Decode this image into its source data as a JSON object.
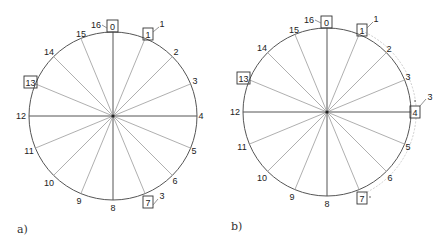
{
  "figure": {
    "panels": [
      {
        "id": "a",
        "label": "a)",
        "center": [
          113,
          116
        ],
        "radius": 84,
        "positions": 16,
        "boxed": [
          "0",
          "1",
          "7",
          "13"
        ],
        "annotations": [
          {
            "text": "16",
            "near": "0"
          },
          {
            "text": "1",
            "near": "1"
          },
          {
            "text": "3",
            "near": "7"
          }
        ]
      },
      {
        "id": "b",
        "label": "b)",
        "center": [
          327,
          112
        ],
        "radius": 84,
        "positions": 16,
        "boxed": [
          "0",
          "1",
          "4",
          "7",
          "13"
        ],
        "annotations": [
          {
            "text": "16",
            "near": "0"
          },
          {
            "text": "1",
            "near": "1"
          },
          {
            "text": "3",
            "near": "4"
          }
        ],
        "arcs": [
          [
            "1",
            "4"
          ],
          [
            "4",
            "7"
          ]
        ]
      }
    ],
    "tick_labels": [
      "0",
      "1",
      "2",
      "3",
      "4",
      "5",
      "6",
      "7",
      "8",
      "9",
      "10",
      "11",
      "12",
      "13",
      "14",
      "15"
    ]
  },
  "panel_a": {
    "label": "a)",
    "lbl": {
      "0": "0",
      "1": "1",
      "2": "2",
      "3": "3",
      "4": "4",
      "5": "5",
      "6": "6",
      "7": "7",
      "8": "8",
      "9": "9",
      "10": "10",
      "11": "11",
      "12": "12",
      "13": "13",
      "14": "14",
      "15": "15"
    },
    "ann_16": "16",
    "ann_1": "1",
    "ann_3": "3"
  },
  "panel_b": {
    "label": "b)",
    "lbl": {
      "0": "0",
      "1": "1",
      "2": "2",
      "3": "3",
      "4": "4",
      "5": "5",
      "6": "6",
      "7": "7",
      "8": "8",
      "9": "9",
      "10": "10",
      "11": "11",
      "12": "12",
      "13": "13",
      "14": "14",
      "15": "15"
    },
    "ann_16": "16",
    "ann_1": "1",
    "ann_3": "3"
  }
}
